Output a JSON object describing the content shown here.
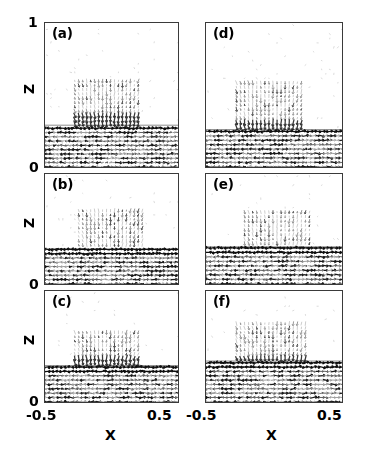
{
  "figure": {
    "type": "quiver-grid",
    "panel_count": 6,
    "columns": 2,
    "rows": 3
  },
  "axes": {
    "x": {
      "label": "X",
      "min_tick": "-0.5",
      "max_tick": "0.5",
      "range": [
        -0.5,
        0.5
      ]
    },
    "y": {
      "label": "Z",
      "min_tick": "0",
      "max_tick": "1",
      "range": [
        0,
        1
      ]
    }
  },
  "panels": [
    {
      "id": "a",
      "label": "(a)",
      "column": 0,
      "row": 0,
      "interface_z": 0.3,
      "plume_top_z": 0.62,
      "plume_bottom_z": 0.3,
      "plume_left_x": -0.28,
      "plume_right_x": 0.22,
      "neck_x": -0.02
    },
    {
      "id": "b",
      "label": "(b)",
      "column": 0,
      "row": 1,
      "interface_z": 0.33,
      "plume_top_z": 0.68,
      "plume_bottom_z": 0.2,
      "plume_left_x": -0.26,
      "plume_right_x": 0.24,
      "neck_x": -0.04
    },
    {
      "id": "c",
      "label": "(c)",
      "column": 0,
      "row": 2,
      "interface_z": 0.34,
      "plume_top_z": 0.66,
      "plume_bottom_z": 0.32,
      "plume_left_x": -0.3,
      "plume_right_x": 0.2,
      "neck_x": -0.05
    },
    {
      "id": "d",
      "label": "(d)",
      "column": 1,
      "row": 0,
      "interface_z": 0.27,
      "plume_top_z": 0.6,
      "plume_bottom_z": 0.22,
      "plume_left_x": -0.3,
      "plume_right_x": 0.22,
      "neck_x": -0.02
    },
    {
      "id": "e",
      "label": "(e)",
      "column": 1,
      "row": 1,
      "interface_z": 0.35,
      "plume_top_z": 0.66,
      "plume_bottom_z": 0.18,
      "plume_left_x": -0.24,
      "plume_right_x": 0.26,
      "neck_x": 0.0
    },
    {
      "id": "f",
      "label": "(f)",
      "column": 1,
      "row": 2,
      "interface_z": 0.38,
      "plume_top_z": 0.72,
      "plume_bottom_z": 0.28,
      "plume_left_x": -0.28,
      "plume_right_x": 0.24,
      "neck_x": -0.02
    }
  ],
  "ticks": {
    "left_y_top": "1",
    "left_y_a_bottom": "0",
    "left_y_b_bottom": "0",
    "left_y_c_bottom": "0",
    "left_x_min": "-0.5",
    "left_x_max": "0.5",
    "right_x_min": "-0.5",
    "right_x_max": "0.5",
    "left_z_a": "Z",
    "left_z_b": "Z",
    "left_z_c": "Z",
    "left_x_label": "X",
    "right_x_label": "X"
  },
  "colors": {
    "frame": "#3a3a3a",
    "arrow_dark": "#101010",
    "arrow_mid": "#6a6a6a",
    "arrow_light": "#b8b8b8",
    "background": "#ffffff"
  }
}
